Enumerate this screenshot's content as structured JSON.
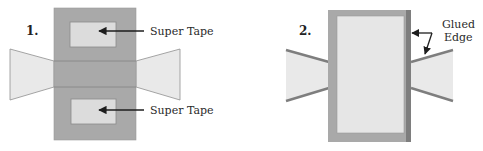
{
  "colors": {
    "body_gray": "#a9a9a9",
    "tape_light": "#dcdcdc",
    "wing_light": "#e9e9e9",
    "edge_dark": "#7e7e7e",
    "arrow": "#1e1e1e",
    "text": "#2a2a2a"
  },
  "panels": [
    {
      "number": "1.",
      "labels": [
        "Super Tape",
        "Super Tape"
      ]
    },
    {
      "number": "2.",
      "labels": [
        "Glued",
        "Edge"
      ]
    }
  ]
}
